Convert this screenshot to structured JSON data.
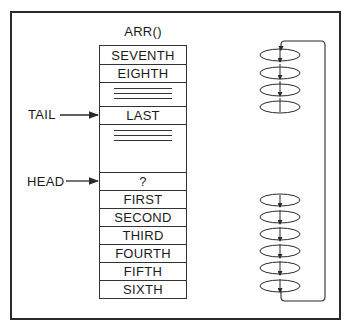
{
  "diagram": {
    "title": "ARR()",
    "cells": [
      {
        "label": "SEVENTH",
        "kind": "value"
      },
      {
        "label": "EIGHTH",
        "kind": "value"
      },
      {
        "label": "",
        "kind": "ellipsis"
      },
      {
        "label": "LAST",
        "kind": "value"
      },
      {
        "label": "",
        "kind": "ellipsis"
      },
      {
        "label": "?",
        "kind": "value"
      },
      {
        "label": "FIRST",
        "kind": "value"
      },
      {
        "label": "SECOND",
        "kind": "value"
      },
      {
        "label": "THIRD",
        "kind": "value"
      },
      {
        "label": "FOURTH",
        "kind": "value"
      },
      {
        "label": "FIFTH",
        "kind": "value"
      },
      {
        "label": "SIXTH",
        "kind": "value"
      }
    ],
    "pointers": {
      "tail": {
        "label": "TAIL",
        "points_to": "LAST"
      },
      "head": {
        "label": "HEAD",
        "points_to": "?"
      }
    },
    "ring_illustration": {
      "top_coils": 4,
      "bottom_coils": 6,
      "description": "circular buffer loop"
    },
    "colors": {
      "line": "#2a2a2a",
      "background": "#ffffff"
    }
  }
}
